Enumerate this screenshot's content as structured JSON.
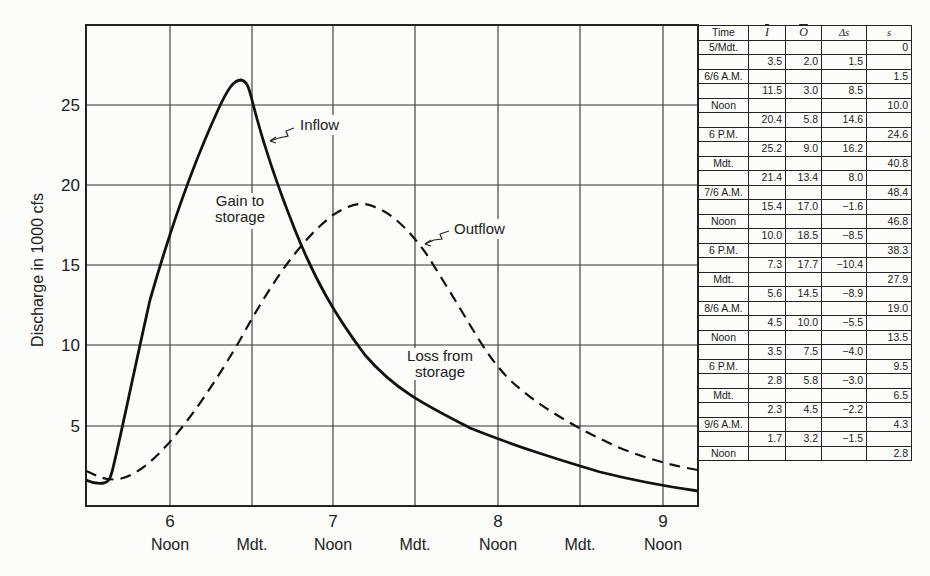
{
  "chart_data": {
    "type": "line",
    "title": "",
    "xlabel": "",
    "ylabel": "Discharge in 1000 cfs",
    "ylim": [
      0,
      30
    ],
    "y_ticks": [
      5,
      10,
      15,
      20,
      25
    ],
    "x_ticks": [
      {
        "day": "6",
        "label": "Noon"
      },
      {
        "day": "",
        "label": "Mdt."
      },
      {
        "day": "7",
        "label": "Noon"
      },
      {
        "day": "",
        "label": "Mdt."
      },
      {
        "day": "8",
        "label": "Noon"
      },
      {
        "day": "",
        "label": "Mdt."
      },
      {
        "day": "9",
        "label": "Noon"
      }
    ],
    "grid": true,
    "x_hours_from_day5_mdt": [
      0,
      6,
      12,
      18,
      24,
      30,
      36,
      42,
      48,
      54,
      60,
      66,
      72,
      78,
      84,
      90,
      96,
      102
    ],
    "series": [
      {
        "name": "Inflow",
        "style": "solid",
        "approx_values": [
          1.7,
          1.6,
          16.0,
          24.5,
          26.5,
          18.0,
          12.0,
          8.5,
          6.5,
          5.2,
          4.2,
          3.5,
          2.9,
          2.5,
          2.2,
          1.9,
          1.7,
          1.2
        ]
      },
      {
        "name": "Outflow",
        "style": "dashed",
        "approx_values": [
          2.2,
          1.7,
          4.5,
          7.5,
          11.5,
          15.5,
          17.8,
          18.8,
          17.5,
          13.0,
          8.5,
          6.5,
          4.8,
          4.0,
          3.3,
          2.8,
          2.5,
          2.3
        ]
      }
    ],
    "annotations": [
      "Inflow",
      "Outflow",
      "Gain to storage",
      "Loss from storage"
    ]
  },
  "table": {
    "headers": [
      "Time",
      "I",
      "O",
      "Δs",
      "s"
    ],
    "rows": [
      {
        "time": "5/Mdt.",
        "I": "",
        "O": "",
        "ds": "",
        "s": "0"
      },
      {
        "time": "",
        "I": "3.5",
        "O": "2.0",
        "ds": "1.5",
        "s": ""
      },
      {
        "time": "6/6 A.M.",
        "I": "",
        "O": "",
        "ds": "",
        "s": "1.5"
      },
      {
        "time": "",
        "I": "11.5",
        "O": "3.0",
        "ds": "8.5",
        "s": ""
      },
      {
        "time": "Noon",
        "I": "",
        "O": "",
        "ds": "",
        "s": "10.0"
      },
      {
        "time": "",
        "I": "20.4",
        "O": "5.8",
        "ds": "14.6",
        "s": ""
      },
      {
        "time": "6 P.M.",
        "I": "",
        "O": "",
        "ds": "",
        "s": "24.6"
      },
      {
        "time": "",
        "I": "25.2",
        "O": "9.0",
        "ds": "16.2",
        "s": ""
      },
      {
        "time": "Mdt.",
        "I": "",
        "O": "",
        "ds": "",
        "s": "40.8"
      },
      {
        "time": "",
        "I": "21.4",
        "O": "13.4",
        "ds": "8.0",
        "s": ""
      },
      {
        "time": "7/6 A.M.",
        "I": "",
        "O": "",
        "ds": "",
        "s": "48.4"
      },
      {
        "time": "",
        "I": "15.4",
        "O": "17.0",
        "ds": "−1.6",
        "s": ""
      },
      {
        "time": "Noon",
        "I": "",
        "O": "",
        "ds": "",
        "s": "46.8"
      },
      {
        "time": "",
        "I": "10.0",
        "O": "18.5",
        "ds": "−8.5",
        "s": ""
      },
      {
        "time": "6 P.M.",
        "I": "",
        "O": "",
        "ds": "",
        "s": "38.3"
      },
      {
        "time": "",
        "I": "7.3",
        "O": "17.7",
        "ds": "−10.4",
        "s": ""
      },
      {
        "time": "Mdt.",
        "I": "",
        "O": "",
        "ds": "",
        "s": "27.9"
      },
      {
        "time": "",
        "I": "5.6",
        "O": "14.5",
        "ds": "−8.9",
        "s": ""
      },
      {
        "time": "8/6 A.M.",
        "I": "",
        "O": "",
        "ds": "",
        "s": "19.0"
      },
      {
        "time": "",
        "I": "4.5",
        "O": "10.0",
        "ds": "−5.5",
        "s": ""
      },
      {
        "time": "Noon",
        "I": "",
        "O": "",
        "ds": "",
        "s": "13.5"
      },
      {
        "time": "",
        "I": "3.5",
        "O": "7.5",
        "ds": "−4.0",
        "s": ""
      },
      {
        "time": "6 P.M.",
        "I": "",
        "O": "",
        "ds": "",
        "s": "9.5"
      },
      {
        "time": "",
        "I": "2.8",
        "O": "5.8",
        "ds": "−3.0",
        "s": ""
      },
      {
        "time": "Mdt.",
        "I": "",
        "O": "",
        "ds": "",
        "s": "6.5"
      },
      {
        "time": "",
        "I": "2.3",
        "O": "4.5",
        "ds": "−2.2",
        "s": ""
      },
      {
        "time": "9/6 A.M.",
        "I": "",
        "O": "",
        "ds": "",
        "s": "4.3"
      },
      {
        "time": "",
        "I": "1.7",
        "O": "3.2",
        "ds": "−1.5",
        "s": ""
      },
      {
        "time": "Noon",
        "I": "",
        "O": "",
        "ds": "",
        "s": "2.8"
      }
    ]
  },
  "labels": {
    "inflow": "Inflow",
    "outflow": "Outflow",
    "gain_1": "Gain to",
    "gain_2": "storage",
    "loss_1": "Loss from",
    "loss_2": "storage"
  }
}
